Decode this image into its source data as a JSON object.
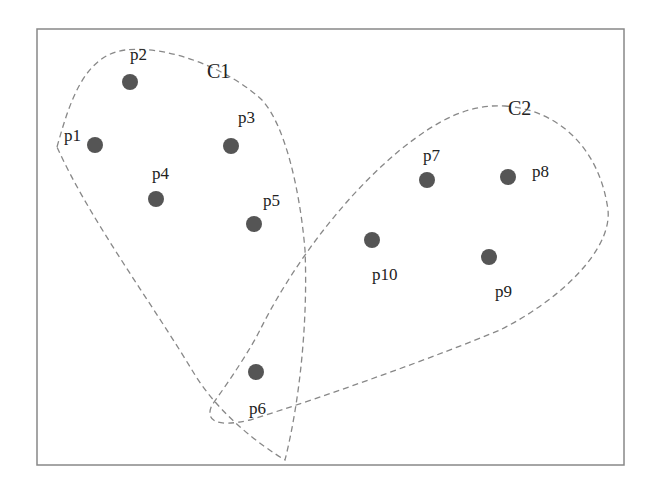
{
  "diagram": {
    "type": "clustering-illustration",
    "frame": {
      "x": 37,
      "y": 29,
      "width": 587,
      "height": 436,
      "stroke": "#888888"
    },
    "point_color": "#555555",
    "boundary_color": "#888888",
    "clusters": [
      {
        "id": "C1",
        "label": "C1",
        "label_pos": [
          207,
          78
        ],
        "members": [
          "p1",
          "p2",
          "p3",
          "p4",
          "p5",
          "p6"
        ]
      },
      {
        "id": "C2",
        "label": "C2",
        "label_pos": [
          508,
          115
        ],
        "members": [
          "p7",
          "p8",
          "p9",
          "p10"
        ]
      }
    ],
    "points": [
      {
        "id": "p1",
        "label": "p1",
        "cx": 95,
        "cy": 145,
        "lx": 64,
        "ly": 141
      },
      {
        "id": "p2",
        "label": "p2",
        "cx": 130,
        "cy": 82,
        "lx": 130,
        "ly": 60
      },
      {
        "id": "p3",
        "label": "p3",
        "cx": 231,
        "cy": 146,
        "lx": 238,
        "ly": 123
      },
      {
        "id": "p4",
        "label": "p4",
        "cx": 156,
        "cy": 199,
        "lx": 152,
        "ly": 179
      },
      {
        "id": "p5",
        "label": "p5",
        "cx": 254,
        "cy": 224,
        "lx": 263,
        "ly": 206
      },
      {
        "id": "p6",
        "label": "p6",
        "cx": 256,
        "cy": 372,
        "lx": 249,
        "ly": 414
      },
      {
        "id": "p7",
        "label": "p7",
        "cx": 427,
        "cy": 180,
        "lx": 423,
        "ly": 161
      },
      {
        "id": "p8",
        "label": "p8",
        "cx": 508,
        "cy": 177,
        "lx": 532,
        "ly": 177
      },
      {
        "id": "p9",
        "label": "p9",
        "cx": 489,
        "cy": 257,
        "lx": 495,
        "ly": 297
      },
      {
        "id": "p10",
        "label": "p10",
        "cx": 372,
        "cy": 240,
        "lx": 372,
        "ly": 280
      }
    ]
  }
}
